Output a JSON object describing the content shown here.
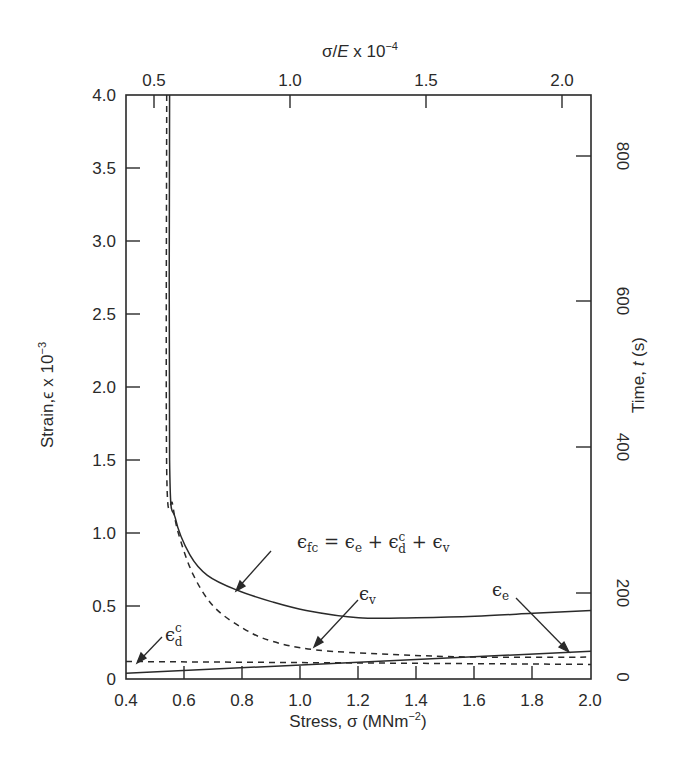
{
  "chart_data": {
    "type": "line",
    "title": "",
    "xlabel": "Stress, σ (MNm⁻²)",
    "ylabel": "Strain,ϵ x 10⁻³",
    "x2label": "σ/E x 10⁻⁴",
    "y2label": "Time, t (s)",
    "xlim": [
      0.4,
      2.0
    ],
    "ylim": [
      0,
      4.0
    ],
    "grid": false,
    "x_ticks": [
      "0.4",
      "0.6",
      "0.8",
      "1.0",
      "1.2",
      "1.4",
      "1.6",
      "1.8",
      "2.0"
    ],
    "y_ticks": [
      "0",
      "0.5",
      "1.0",
      "1.5",
      "2.0",
      "2.5",
      "3.0",
      "3.5",
      "4.0"
    ],
    "x2_ticks": [
      "0.5",
      "1.0",
      "1.5",
      "2.0"
    ],
    "y2_ticks": [
      "0",
      "200",
      "400",
      "600",
      "800"
    ],
    "series": [
      {
        "name": "ϵfc = ϵe + ϵdc + ϵv",
        "style": "solid",
        "x": [
          0.55,
          0.55,
          0.57,
          0.62,
          0.68,
          0.78,
          0.9,
          1.02,
          1.2,
          1.4,
          1.6,
          1.8,
          2.0
        ],
        "y": [
          4.0,
          1.5,
          1.1,
          0.85,
          0.71,
          0.61,
          0.53,
          0.47,
          0.42,
          0.42,
          0.43,
          0.45,
          0.47
        ]
      },
      {
        "name": "ϵv",
        "style": "dashed",
        "x": [
          0.54,
          0.54,
          0.56,
          0.58,
          0.63,
          0.7,
          0.8,
          0.9,
          1.05,
          1.3,
          1.6,
          2.0
        ],
        "y": [
          4.0,
          1.43,
          1.2,
          1.0,
          0.72,
          0.5,
          0.35,
          0.26,
          0.2,
          0.17,
          0.15,
          0.15
        ]
      },
      {
        "name": "ϵdc",
        "style": "dashed",
        "x": [
          0.4,
          2.0
        ],
        "y": [
          0.12,
          0.1
        ]
      },
      {
        "name": "ϵe",
        "style": "solid",
        "x": [
          0.4,
          2.0
        ],
        "y": [
          0.04,
          0.19
        ]
      }
    ],
    "annotations": [
      {
        "text": "ϵfc = ϵe + ϵdc + ϵv",
        "points_to": "total strain curve"
      },
      {
        "text": "ϵv",
        "points_to": "viscous strain (dashed)"
      },
      {
        "text": "ϵe",
        "points_to": "elastic strain line"
      },
      {
        "text": "ϵdc",
        "points_to": "delayed elastic strain (dashed)"
      }
    ]
  },
  "labels": {
    "xlabel_main": "Stress, σ (MNm",
    "xlabel_sup": "−2",
    "xlabel_end": ")",
    "x2label_main": "σ/",
    "x2label_E": "E",
    "x2label_mid": " x 10",
    "x2label_sup": "−4",
    "ylabel_main": "Strain,ϵ x 10",
    "ylabel_sup": "−3",
    "y2label_main": "Time, ",
    "y2label_t": "t",
    "y2label_end": " (s)",
    "eq_lhs": "ϵ",
    "eq_lhs_sub": "fc",
    "eq_eq": " = ϵ",
    "eq_e_sub": "e",
    "eq_plus1": " + ϵ",
    "eq_d_sup": "c",
    "eq_d_sub": "d",
    "eq_plus2": " + ϵ",
    "eq_v_sub": "v",
    "ev": "ϵ",
    "ev_sub": "v",
    "ee": "ϵ",
    "ee_sub": "e",
    "edc": "ϵ",
    "edc_sup": "c",
    "edc_sub": "d"
  },
  "ticks": {
    "x": [
      {
        "label": "0.4",
        "px": 126
      },
      {
        "label": "0.6",
        "px": 184
      },
      {
        "label": "0.8",
        "px": 242
      },
      {
        "label": "1.0",
        "px": 300
      },
      {
        "label": "1.2",
        "px": 358
      },
      {
        "label": "1.4",
        "px": 416
      },
      {
        "label": "1.6",
        "px": 474
      },
      {
        "label": "1.8",
        "px": 532
      },
      {
        "label": "2.0",
        "px": 590
      }
    ],
    "y": [
      {
        "label": "0",
        "px": 679
      },
      {
        "label": "0.5",
        "px": 606
      },
      {
        "label": "1.0",
        "px": 533
      },
      {
        "label": "1.5",
        "px": 460
      },
      {
        "label": "2.0",
        "px": 387
      },
      {
        "label": "2.5",
        "px": 314
      },
      {
        "label": "3.0",
        "px": 241
      },
      {
        "label": "3.5",
        "px": 168
      },
      {
        "label": "4.0",
        "px": 95
      }
    ],
    "x2": [
      {
        "label": "0.5",
        "px": 154
      },
      {
        "label": "1.0",
        "px": 290
      },
      {
        "label": "1.5",
        "px": 426
      },
      {
        "label": "2.0",
        "px": 562
      }
    ],
    "y2": [
      {
        "label": "0",
        "px": 677
      },
      {
        "label": "200",
        "px": 593
      },
      {
        "label": "400",
        "px": 447
      },
      {
        "label": "600",
        "px": 301
      },
      {
        "label": "800",
        "px": 156
      }
    ]
  }
}
